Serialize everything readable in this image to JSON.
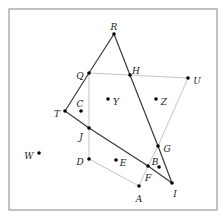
{
  "diagram": {
    "frame": {
      "x": 9,
      "y": 9,
      "width": 208,
      "height": 201
    },
    "points": [
      {
        "name": "R",
        "x": 114,
        "y": 34,
        "lx": 114,
        "ly": 27,
        "anchor": "middle"
      },
      {
        "name": "Q",
        "x": 89,
        "y": 73,
        "lx": 80,
        "ly": 76,
        "anchor": "middle"
      },
      {
        "name": "H",
        "x": 130,
        "y": 75,
        "lx": 136,
        "ly": 71,
        "anchor": "middle"
      },
      {
        "name": "U",
        "x": 188,
        "y": 78,
        "lx": 197,
        "ly": 81,
        "anchor": "middle"
      },
      {
        "name": "Y",
        "x": 108,
        "y": 99,
        "lx": 116,
        "ly": 102,
        "anchor": "middle"
      },
      {
        "name": "Z",
        "x": 156,
        "y": 99,
        "lx": 164,
        "ly": 102,
        "anchor": "middle"
      },
      {
        "name": "C",
        "x": 81,
        "y": 111,
        "lx": 80,
        "ly": 104,
        "anchor": "middle"
      },
      {
        "name": "T",
        "x": 65,
        "y": 111,
        "lx": 57,
        "ly": 114,
        "anchor": "middle"
      },
      {
        "name": "J",
        "x": 89,
        "y": 128,
        "lx": 81,
        "ly": 137,
        "anchor": "middle"
      },
      {
        "name": "G",
        "x": 158,
        "y": 146,
        "lx": 167,
        "ly": 149,
        "anchor": "middle"
      },
      {
        "name": "W",
        "x": 39,
        "y": 153,
        "lx": 29,
        "ly": 156,
        "anchor": "middle"
      },
      {
        "name": "D",
        "x": 89,
        "y": 159,
        "lx": 80,
        "ly": 162,
        "anchor": "middle"
      },
      {
        "name": "E",
        "x": 116,
        "y": 160,
        "lx": 123,
        "ly": 163,
        "anchor": "middle"
      },
      {
        "name": "B",
        "x": 159,
        "y": 167,
        "lx": 155,
        "ly": 162,
        "anchor": "middle"
      },
      {
        "name": "F",
        "x": 148,
        "y": 166,
        "lx": 148,
        "ly": 178,
        "anchor": "middle"
      },
      {
        "name": "I",
        "x": 172,
        "y": 183,
        "lx": 175,
        "ly": 194,
        "anchor": "middle"
      },
      {
        "name": "A",
        "x": 139,
        "y": 186,
        "lx": 139,
        "ly": 199,
        "anchor": "middle"
      }
    ],
    "dark_segments": [
      [
        "R",
        "Q"
      ],
      [
        "Q",
        "T"
      ],
      [
        "T",
        "J"
      ],
      [
        "J",
        "F"
      ],
      [
        "F",
        "I"
      ],
      [
        "R",
        "H"
      ],
      [
        "H",
        "G"
      ],
      [
        "G",
        "I"
      ]
    ],
    "light_segments": [
      [
        "Q",
        "H"
      ],
      [
        "H",
        "U"
      ],
      [
        "U",
        "G"
      ],
      [
        "G",
        "F"
      ],
      [
        "F",
        "A"
      ],
      [
        "A",
        "D"
      ],
      [
        "D",
        "J"
      ],
      [
        "J",
        "Q"
      ]
    ],
    "colors": {
      "dark_line": "#3a3a3a",
      "light_line": "#c4c4c4",
      "point": "#000000",
      "frame": "#9a9a9a"
    }
  }
}
